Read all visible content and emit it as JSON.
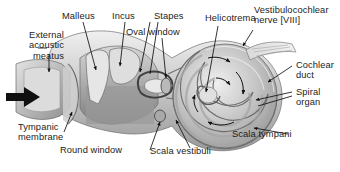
{
  "diagram": {
    "type": "anatomical-cross-section",
    "background_color": "#ffffff",
    "text_color": "#1b1b1b",
    "line_color": "#111111",
    "arrow_color": "#101010"
  },
  "labels": {
    "external_acoustic_meatus": "External\nacoustic\nmeatus",
    "malleus": "Malleus",
    "incus": "Incus",
    "stapes": "Stapes",
    "oval_window": "Oval window",
    "helicotrema": "Helicotrema",
    "vestibulocochlear_nerve": "Vestibulocochlear\nnerve [VIII]",
    "cochlear_duct": "Cochlear\nduct",
    "spiral_organ": "Spiral\norgan",
    "scala_tympani": "Scala tympani",
    "scala_vestibuli": "Scala vestibuli",
    "round_window": "Round window",
    "tympanic_membrane": "Tympanic\nmembrane"
  },
  "structures": [
    {
      "name": "external-acoustic-meatus",
      "region": "left ear canal"
    },
    {
      "name": "tympanic-membrane",
      "region": "canal terminus"
    },
    {
      "name": "malleus",
      "region": "middle ear ossicle"
    },
    {
      "name": "incus",
      "region": "middle ear ossicle"
    },
    {
      "name": "stapes",
      "region": "middle ear ossicle at oval window"
    },
    {
      "name": "oval-window",
      "region": "vestibule entry"
    },
    {
      "name": "round-window",
      "region": "below oval window"
    },
    {
      "name": "cochlea-spiral",
      "region": "right coiled body"
    },
    {
      "name": "helicotrema",
      "region": "cochlear apex"
    },
    {
      "name": "vestibulocochlear-nerve",
      "region": "exits upper right"
    },
    {
      "name": "cochlear-duct",
      "region": "spiral canal"
    },
    {
      "name": "spiral-organ",
      "region": "within cochlear duct"
    },
    {
      "name": "scala-vestibuli",
      "region": "upper cochlear canal"
    },
    {
      "name": "scala-tympani",
      "region": "lower cochlear canal"
    }
  ],
  "sound_direction_arrow": "sound enters external acoustic meatus"
}
